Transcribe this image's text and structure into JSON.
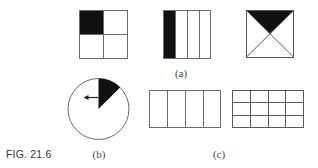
{
  "figure": {
    "caption": "FIG. 21.6",
    "colors": {
      "stroke": "#6a6a6a",
      "fill": "#111111",
      "background": "#ffffff"
    },
    "panels": {
      "a": {
        "label": "(a)",
        "shapes": [
          {
            "name": "square-quarters",
            "grid": "2x2",
            "shaded": "top-left quarter"
          },
          {
            "name": "square-vertical-strips",
            "grid": "1x4",
            "shaded": "leftmost strip"
          },
          {
            "name": "square-diagonals",
            "grid": "4 triangles",
            "shaded": "top triangle"
          }
        ]
      },
      "b": {
        "label": "(b)",
        "shapes": [
          {
            "name": "circle-sector",
            "shaded": "sector from 12 o'clock to ~1:30",
            "arrow": "pointing left"
          }
        ]
      },
      "c": {
        "label": "(c)",
        "shapes": [
          {
            "name": "rectangle-four-columns",
            "grid": "1x4",
            "shaded": "none"
          },
          {
            "name": "rectangle-grid",
            "grid": "3x4",
            "shaded": "none"
          }
        ]
      }
    }
  }
}
